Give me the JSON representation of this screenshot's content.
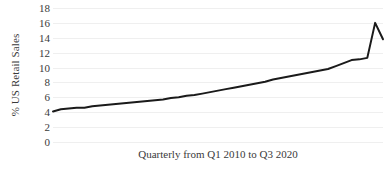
{
  "chart_data": {
    "type": "line",
    "title": "",
    "xlabel": "Quarterly from Q1 2010 to Q3 2020",
    "ylabel": "% US Retail Sales",
    "ylim": [
      0,
      18
    ],
    "yticks": [
      0,
      2,
      4,
      6,
      8,
      10,
      12,
      14,
      16,
      18
    ],
    "ytick_labels": [
      "0",
      "2",
      "4",
      "6",
      "8",
      "10",
      "12",
      "14",
      "16",
      "18"
    ],
    "grid": true,
    "legend": "none",
    "line_color": "#1a1a1a",
    "line_width": 2,
    "categories": [
      "Q1 2010",
      "Q2 2010",
      "Q3 2010",
      "Q4 2010",
      "Q1 2011",
      "Q2 2011",
      "Q3 2011",
      "Q4 2011",
      "Q1 2012",
      "Q2 2012",
      "Q3 2012",
      "Q4 2012",
      "Q1 2013",
      "Q2 2013",
      "Q3 2013",
      "Q4 2013",
      "Q1 2014",
      "Q2 2014",
      "Q3 2014",
      "Q4 2014",
      "Q1 2015",
      "Q2 2015",
      "Q3 2015",
      "Q4 2015",
      "Q1 2016",
      "Q2 2016",
      "Q3 2016",
      "Q4 2016",
      "Q1 2017",
      "Q2 2017",
      "Q3 2017",
      "Q4 2017",
      "Q1 2018",
      "Q2 2018",
      "Q3 2018",
      "Q4 2018",
      "Q1 2019",
      "Q2 2019",
      "Q3 2019",
      "Q4 2019",
      "Q1 2020",
      "Q2 2020",
      "Q3 2020"
    ],
    "values": [
      4.1,
      4.4,
      4.5,
      4.6,
      4.6,
      4.8,
      4.9,
      5.0,
      5.1,
      5.2,
      5.3,
      5.4,
      5.5,
      5.6,
      5.7,
      5.9,
      6.0,
      6.2,
      6.3,
      6.5,
      6.7,
      6.9,
      7.1,
      7.3,
      7.5,
      7.7,
      7.9,
      8.1,
      8.4,
      8.6,
      8.8,
      9.0,
      9.2,
      9.4,
      9.6,
      9.8,
      10.2,
      10.6,
      11.0,
      11.1,
      11.3,
      16.0,
      13.8
    ],
    "xtick_labels": []
  }
}
